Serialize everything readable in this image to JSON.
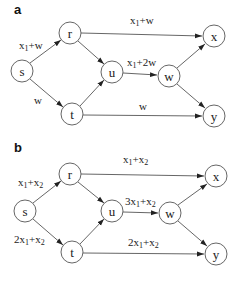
{
  "panels": [
    {
      "label": "a",
      "nodes": {
        "s": {
          "label": "s",
          "x": 22,
          "y": 71
        },
        "r": {
          "label": "r",
          "x": 70,
          "y": 33
        },
        "t": {
          "label": "t",
          "x": 72,
          "y": 114
        },
        "u": {
          "label": "u",
          "x": 112,
          "y": 72
        },
        "w": {
          "label": "w",
          "x": 169,
          "y": 76
        },
        "x": {
          "label": "x",
          "x": 214,
          "y": 36
        },
        "y": {
          "label": "y",
          "x": 214,
          "y": 116
        }
      },
      "edges": [
        {
          "from": "s",
          "to": "r",
          "label": "x1+w"
        },
        {
          "from": "s",
          "to": "t",
          "label": "w"
        },
        {
          "from": "r",
          "to": "u",
          "label": ""
        },
        {
          "from": "t",
          "to": "u",
          "label": ""
        },
        {
          "from": "r",
          "to": "x",
          "label": "x1+w"
        },
        {
          "from": "u",
          "to": "w",
          "label": "x1+2w"
        },
        {
          "from": "t",
          "to": "y",
          "label": "w"
        },
        {
          "from": "w",
          "to": "x",
          "label": ""
        },
        {
          "from": "w",
          "to": "y",
          "label": ""
        }
      ],
      "edge_labels": {
        "s_r": {
          "pre": "x",
          "sub": "1",
          "post": "+w"
        },
        "s_t": {
          "pre": "w",
          "sub": "",
          "post": ""
        },
        "r_x": {
          "pre": "x",
          "sub": "1",
          "post": "+w"
        },
        "u_w": {
          "pre": "x",
          "sub": "1",
          "post": "+2w"
        },
        "t_y": {
          "pre": "w",
          "sub": "",
          "post": ""
        }
      }
    },
    {
      "label": "b",
      "nodes": {
        "s": {
          "label": "s",
          "x": 25,
          "y": 211
        },
        "r": {
          "label": "r",
          "x": 70,
          "y": 174
        },
        "t": {
          "label": "t",
          "x": 72,
          "y": 252
        },
        "u": {
          "label": "u",
          "x": 112,
          "y": 211
        },
        "w": {
          "label": "w",
          "x": 170,
          "y": 213
        },
        "x": {
          "label": "x",
          "x": 216,
          "y": 176
        },
        "y": {
          "label": "y",
          "x": 216,
          "y": 254
        }
      },
      "edges": [
        {
          "from": "s",
          "to": "r",
          "label": "x1+x2"
        },
        {
          "from": "s",
          "to": "t",
          "label": "2x1+x2"
        },
        {
          "from": "r",
          "to": "u",
          "label": ""
        },
        {
          "from": "t",
          "to": "u",
          "label": ""
        },
        {
          "from": "r",
          "to": "x",
          "label": "x1+x2"
        },
        {
          "from": "u",
          "to": "w",
          "label": "3x1+x2"
        },
        {
          "from": "t",
          "to": "y",
          "label": "2x1+x2"
        },
        {
          "from": "w",
          "to": "x",
          "label": ""
        },
        {
          "from": "w",
          "to": "y",
          "label": ""
        }
      ],
      "edge_labels": {
        "s_r": {
          "a": "x",
          "a_sub": "1",
          "mid": "+x",
          "b_sub": "2"
        },
        "s_t": {
          "a": "2x",
          "a_sub": "1",
          "mid": "+x",
          "b_sub": "2"
        },
        "r_x": {
          "a": "x",
          "a_sub": "1",
          "mid": "+x",
          "b_sub": "2"
        },
        "u_w": {
          "a": "3x",
          "a_sub": "1",
          "mid": "+x",
          "b_sub": "2"
        },
        "t_y": {
          "a": "2x",
          "a_sub": "1",
          "mid": "+x",
          "b_sub": "2"
        }
      }
    }
  ]
}
